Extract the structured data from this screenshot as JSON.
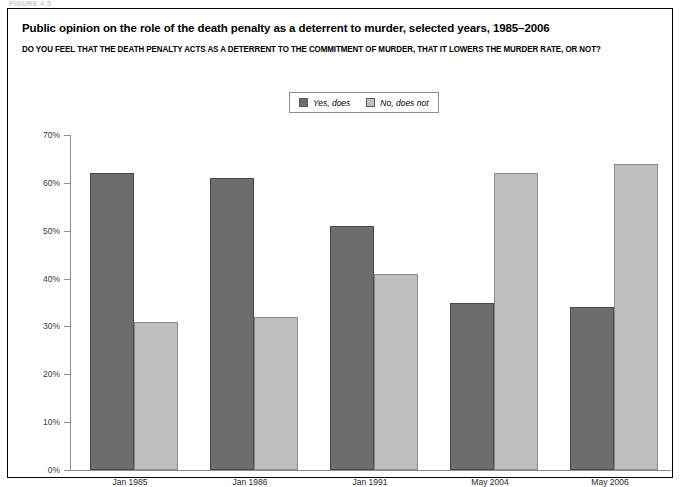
{
  "figure": {
    "eyebrow": "FIGURE 4.5",
    "frame_name": "figure-frame"
  },
  "chart_data": {
    "type": "bar",
    "title": "Public opinion on the role of the death penalty as a deterrent to murder, selected years, 1985–2006",
    "subtitle": "DO YOU FEEL THAT THE DEATH PENALTY ACTS AS A DETERRENT TO THE COMMITMENT OF MURDER, THAT IT LOWERS THE MURDER RATE, OR NOT?",
    "categories": [
      "Jan 1985",
      "Jan 1986",
      "Jan 1991",
      "May 2004",
      "May 2006"
    ],
    "series": [
      {
        "name": "Yes, does",
        "color": "#6d6d6d",
        "values": [
          62,
          61,
          51,
          35,
          34
        ]
      },
      {
        "name": "No, does not",
        "color": "#bfbfbf",
        "values": [
          31,
          32,
          41,
          62,
          64
        ]
      }
    ],
    "xlabel": "",
    "ylabel": "",
    "ylim": [
      0,
      70
    ],
    "ytick_values": [
      0,
      10,
      20,
      30,
      40,
      50,
      60,
      70
    ],
    "ytick_labels": [
      "0%",
      "10%",
      "20%",
      "30%",
      "40%",
      "50%",
      "60%",
      "70%"
    ],
    "grid": false,
    "legend_position": "top-center",
    "value_suffix": "%"
  }
}
